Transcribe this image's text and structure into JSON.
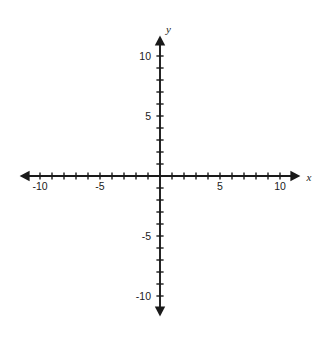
{
  "chart_data": {
    "type": "scatter",
    "title": "",
    "subtitle": "",
    "xlabel": "x",
    "ylabel": "y",
    "xlim": [
      -11.5,
      11.5
    ],
    "ylim": [
      -11.5,
      11.5
    ],
    "grid": false,
    "legend": null,
    "series": [],
    "values": [],
    "x": [],
    "annotations": [],
    "x_tick_labels": [
      "-10",
      "-5",
      "5",
      "10"
    ],
    "x_tick_values": [
      -10,
      -5,
      5,
      10
    ],
    "y_tick_labels": [
      "10",
      "5",
      "-5",
      "-10"
    ],
    "y_tick_values": [
      10,
      5,
      -5,
      -10
    ],
    "minor_tick_interval": 1,
    "major_tick_interval": 5,
    "axis_style": "four-arrow-cartesian"
  },
  "geometry": {
    "origin_x": 160,
    "origin_y": 176,
    "unit_px": 12,
    "x_min_unit": -11.7,
    "x_max_unit": 11.7,
    "y_min_unit": -11.7,
    "y_max_unit": 11.7,
    "tick_half_len": 3.6,
    "arrow_len": 10,
    "arrow_halfwidth": 5.2
  },
  "labels": {
    "x_axis_name": "x",
    "y_axis_name": "y",
    "x_neg_ten": "-10",
    "x_neg_five": "-5",
    "x_pos_five": "5",
    "x_pos_ten": "10",
    "y_pos_ten": "10",
    "y_pos_five": "5",
    "y_neg_five": "-5",
    "y_neg_ten": "-10"
  },
  "colors": {
    "background": "#ffffff",
    "ink": "#1a1a1a"
  }
}
